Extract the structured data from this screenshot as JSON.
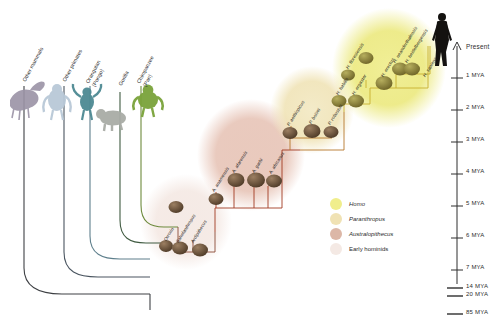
{
  "figure": {
    "background": "#ffffff"
  },
  "outgroup_labels": [
    {
      "name": "other-mammals",
      "line1": "Other mammals",
      "line2": "",
      "x": 22,
      "y": 78,
      "branch_color": "#3e4044"
    },
    {
      "name": "other-primates",
      "line1": "Other primates",
      "line2": "",
      "x": 62,
      "y": 78,
      "branch_color": "#4a5560"
    },
    {
      "name": "orangutan",
      "line1": "Orangutan",
      "line2": "(Pongo)",
      "x": 88,
      "y": 78,
      "branch_color": "#5e7f8c"
    },
    {
      "name": "gorilla",
      "line1": "Gorilla",
      "line2": "",
      "x": 118,
      "y": 78,
      "branch_color": "#3f5a40"
    },
    {
      "name": "chimpanzee",
      "line1": "Chimpanzee",
      "line2": "(Pan)",
      "x": 139,
      "y": 78,
      "branch_color": "#6d8a3c"
    }
  ],
  "clusters": [
    {
      "name": "early-hominids",
      "color": "#f2e4de",
      "cx": 186,
      "cy": 222,
      "rx": 44,
      "ry": 46
    },
    {
      "name": "australopithecus",
      "color": "#e7c5b9",
      "cx": 251,
      "cy": 155,
      "rx": 52,
      "ry": 54
    },
    {
      "name": "paranthropus",
      "color": "#f0e6c0",
      "cx": 312,
      "cy": 110,
      "rx": 40,
      "ry": 42
    },
    {
      "name": "homo",
      "color": "#ebe87f",
      "cx": 387,
      "cy": 68,
      "rx": 55,
      "ry": 58
    }
  ],
  "species": [
    {
      "name": "orrorin",
      "label": "Orrorin",
      "x": 165,
      "y": 238,
      "connector_color": "#8a4a36"
    },
    {
      "name": "sahelanthropus",
      "label": "Sahelanthropus",
      "x": 177,
      "y": 240,
      "connector_color": "#8a4a36"
    },
    {
      "name": "ardipithecus",
      "label": "Ardipithecus",
      "x": 192,
      "y": 240,
      "connector_color": "#8a4a36"
    },
    {
      "name": "a-anamensis",
      "label": "A. anamensis",
      "x": 213,
      "y": 185,
      "connector_color": "#a23b23"
    },
    {
      "name": "a-afarensis",
      "label": "A. afarensis",
      "x": 233,
      "y": 167,
      "connector_color": "#a23b23"
    },
    {
      "name": "a-garhi",
      "label": "A. garhi",
      "x": 253,
      "y": 160,
      "connector_color": "#a23b23"
    },
    {
      "name": "a-africanus",
      "label": "A. africanus",
      "x": 266,
      "y": 168,
      "connector_color": "#a23b23"
    },
    {
      "name": "p-aethiopicus",
      "label": "P. aethiopicus",
      "x": 288,
      "y": 120,
      "connector_color": "#b5772a"
    },
    {
      "name": "p-boisei",
      "label": "P. boisei",
      "x": 310,
      "y": 118,
      "connector_color": "#b5772a"
    },
    {
      "name": "p-robustus",
      "label": "P. robustus",
      "x": 329,
      "y": 118,
      "connector_color": "#b5772a"
    },
    {
      "name": "h-habilis",
      "label": "H. habilis",
      "x": 337,
      "y": 98,
      "connector_color": "#c7b02f"
    },
    {
      "name": "h-ergaster",
      "label": "H. ergaster",
      "x": 352,
      "y": 96,
      "connector_color": "#c7b02f"
    },
    {
      "name": "h-floresiensis",
      "label": "H. floresiensis",
      "x": 363,
      "y": 81,
      "connector_color": "#c7b02f"
    },
    {
      "name": "h-erectus",
      "label": "H. erectus",
      "x": 381,
      "y": 77,
      "connector_color": "#c7b02f"
    },
    {
      "name": "h-neanderthalensis",
      "label": "H. neanderthalensis",
      "x": 393,
      "y": 69,
      "connector_color": "#c7b02f"
    },
    {
      "name": "h-heidelbergensis",
      "label": "H. heidelbergensis",
      "x": 405,
      "y": 70,
      "connector_color": "#c7b02f"
    },
    {
      "name": "h-sapiens",
      "label": "H. sapiens",
      "x": 424,
      "y": 62,
      "connector_color": "#c7b02f"
    }
  ],
  "axis": {
    "name": "time-axis",
    "present_label": "Present",
    "ticks": [
      {
        "label": "1 MYA",
        "y": 78
      },
      {
        "label": "2 MYA",
        "y": 110
      },
      {
        "label": "3 MYA",
        "y": 142
      },
      {
        "label": "4 MYA",
        "y": 174
      },
      {
        "label": "5 MYA",
        "y": 206
      },
      {
        "label": "6 MYA",
        "y": 238
      },
      {
        "label": "7 MYA",
        "y": 270
      }
    ],
    "deep_ticks": [
      {
        "label": "14 MYA",
        "y": 288
      },
      {
        "label": "20 MYA",
        "y": 296
      },
      {
        "label": "85 MYA",
        "y": 314
      }
    ]
  },
  "legend": {
    "name": "cluster-legend",
    "items": [
      {
        "label": "Homo",
        "color": "#f0ee8c",
        "italic": true
      },
      {
        "label": "Paranthropus",
        "color": "#f0e2b4",
        "italic": true
      },
      {
        "label": "Australopithecus",
        "color": "#dcb7a7",
        "italic": true
      },
      {
        "label": "Early hominids",
        "color": "#f4e9e4",
        "italic": false
      }
    ]
  },
  "colors": {
    "tree_stroke": "#3e4044",
    "homo_accent": "#c7b02f",
    "paranthropus_accent": "#b5772a",
    "australopithecus_accent": "#a23b23",
    "early_accent": "#8a4a36"
  }
}
